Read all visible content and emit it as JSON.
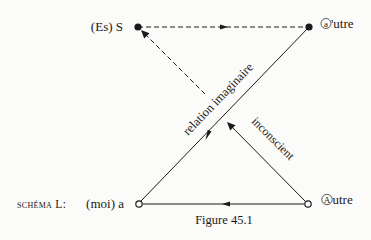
{
  "figure": {
    "caption": "Figure 45.1",
    "schema_label": "schéma L:",
    "nodes": {
      "top_left": {
        "label": "(Es) S",
        "style": "filled"
      },
      "top_right": {
        "label": "a'utre",
        "circled_letter": "a",
        "rest": "'utre",
        "style": "filled"
      },
      "bottom_left": {
        "label": "(moi) a",
        "style": "open"
      },
      "bottom_right": {
        "label": "Autre",
        "circled_letter": "A",
        "rest": "utre",
        "style": "open"
      }
    },
    "edges": {
      "diagonal_solid_label": "relation imaginaire",
      "diagonal_lower_label": "inconscient"
    },
    "colors": {
      "ink": "#1a1a1a",
      "paper": "#fbfbf9"
    }
  }
}
